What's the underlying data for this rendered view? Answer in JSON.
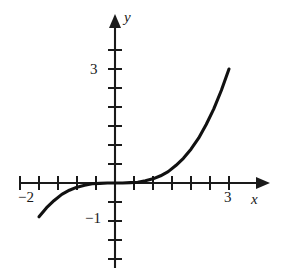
{
  "figure": {
    "name": "cubic-function-graph",
    "background_color": "#ffffff",
    "ink_color": "#1a1a1a"
  },
  "axes": {
    "x_axis_label": "x",
    "y_axis_label": "y",
    "origin_px": [
      115,
      183
    ],
    "unit_px": 38,
    "tick_interval_units": 0.5,
    "x_range_units": [
      -2.5,
      3.6
    ],
    "y_range_units": [
      -2.6,
      3.9
    ],
    "x_tick_labels": [
      {
        "value": -2,
        "text": "−2"
      },
      {
        "value": 3,
        "text": "3"
      }
    ],
    "y_tick_labels": [
      {
        "value": 3,
        "text": "3"
      },
      {
        "value": -1,
        "text": "−1"
      }
    ],
    "x_ticks_units": [
      -2.5,
      -2,
      -1.5,
      -1,
      -0.5,
      0.5,
      1,
      1.5,
      2,
      2.5,
      3
    ],
    "y_ticks_units": [
      3.5,
      3,
      2.5,
      2,
      1.5,
      1,
      0.5,
      -0.5,
      -1,
      -1.5,
      -2
    ],
    "arrow_heads": [
      "x-positive",
      "y-positive"
    ],
    "grid": false
  },
  "chart_data": {
    "type": "line",
    "title": "",
    "xlabel": "x",
    "ylabel": "y",
    "xlim": [
      -2.5,
      3.6
    ],
    "ylim": [
      -2.6,
      3.9
    ],
    "grid": false,
    "legend": "none",
    "series": [
      {
        "name": "y = x³/9",
        "color": "#111111",
        "x": [
          -2.0,
          -1.8,
          -1.6,
          -1.4,
          -1.2,
          -1.0,
          -0.8,
          -0.6,
          -0.4,
          -0.2,
          0.0,
          0.2,
          0.4,
          0.6,
          0.8,
          1.0,
          1.2,
          1.4,
          1.6,
          1.8,
          2.0,
          2.2,
          2.4,
          2.6,
          2.8,
          3.0
        ],
        "y": [
          -0.89,
          -0.65,
          -0.46,
          -0.3,
          -0.19,
          -0.11,
          -0.06,
          -0.02,
          -0.01,
          0.0,
          0.0,
          0.0,
          0.01,
          0.02,
          0.06,
          0.11,
          0.19,
          0.3,
          0.46,
          0.65,
          0.89,
          1.18,
          1.54,
          1.95,
          2.44,
          3.0
        ]
      }
    ],
    "annotations": []
  }
}
